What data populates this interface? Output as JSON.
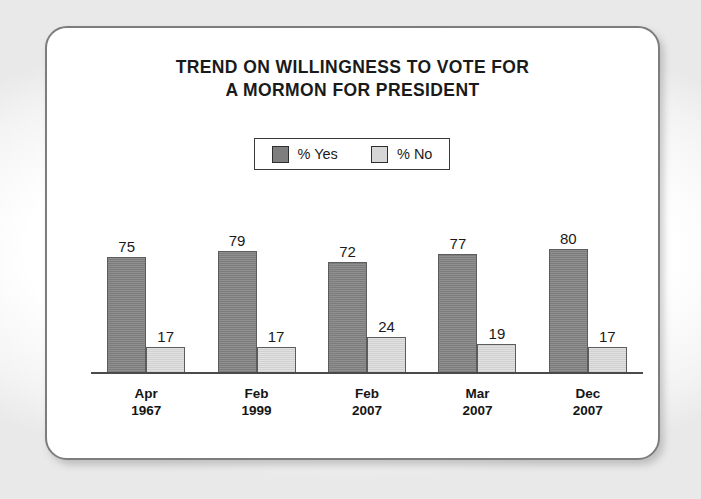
{
  "chart_data": {
    "type": "bar",
    "title": "TREND ON WILLINGNESS TO VOTE FOR A MORMON FOR PRESIDENT",
    "title_line1": "TREND ON WILLINGNESS TO VOTE FOR",
    "title_line2": "A MORMON FOR PRESIDENT",
    "categories": [
      "Apr 1967",
      "Feb 1999",
      "Feb 2007",
      "Mar 2007",
      "Dec 2007"
    ],
    "category_lines": [
      {
        "month": "Apr",
        "year": "1967"
      },
      {
        "month": "Feb",
        "year": "1999"
      },
      {
        "month": "Feb",
        "year": "2007"
      },
      {
        "month": "Mar",
        "year": "2007"
      },
      {
        "month": "Dec",
        "year": "2007"
      }
    ],
    "series": [
      {
        "name": "% Yes",
        "color": "#838383",
        "values": [
          75,
          79,
          72,
          77,
          80
        ]
      },
      {
        "name": "% No",
        "color": "#d9d9d9",
        "values": [
          17,
          17,
          24,
          19,
          17
        ]
      }
    ],
    "xlabel": "",
    "ylabel": "",
    "ylim": [
      0,
      100
    ],
    "grid": false,
    "legend_position": "top-center",
    "data_labels": true
  },
  "legend": {
    "items": [
      {
        "label": "% Yes",
        "swatch": "dark-gray-swatch"
      },
      {
        "label": "% No",
        "swatch": "light-gray-swatch"
      }
    ]
  },
  "colors": {
    "series_yes": "#838383",
    "series_no": "#d9d9d9",
    "axis": "#4a4a4a",
    "frame_border": "#7d7d7d",
    "text": "#1a1a1a",
    "background": "#ffffff"
  }
}
